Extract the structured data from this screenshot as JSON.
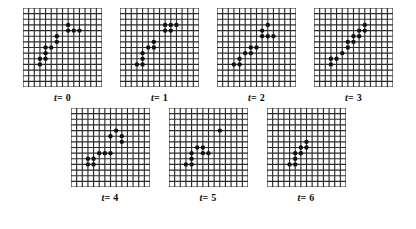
{
  "figure": {
    "title": "",
    "grid": {
      "cols": 14,
      "rows": 14,
      "cell_px": 5.4,
      "line_color": "#2b2b2b",
      "line_width": 1.1,
      "background": "#ffffff"
    },
    "dot": {
      "color": "#111111",
      "radius_px": 2.1,
      "shape": "filled-circle"
    },
    "label_prefix": "t",
    "label_equals": "=",
    "panels": [
      {
        "name": "panel-t0",
        "label_value": "0",
        "label_text": "t= 0",
        "dot_count": 12,
        "cells": [
          [
            3,
            10
          ],
          [
            3,
            9
          ],
          [
            4,
            9
          ],
          [
            4,
            8
          ],
          [
            4,
            7
          ],
          [
            5,
            7
          ],
          [
            6,
            6
          ],
          [
            6,
            5
          ],
          [
            8,
            3
          ],
          [
            8,
            4
          ],
          [
            9,
            4
          ],
          [
            10,
            4
          ]
        ]
      },
      {
        "name": "panel-t1",
        "label_value": "1",
        "label_text": "t= 1",
        "dot_count": 12,
        "cells": [
          [
            3,
            10
          ],
          [
            4,
            10
          ],
          [
            4,
            9
          ],
          [
            4,
            8
          ],
          [
            5,
            7
          ],
          [
            6,
            7
          ],
          [
            6,
            6
          ],
          [
            8,
            3
          ],
          [
            8,
            4
          ],
          [
            9,
            4
          ],
          [
            9,
            3
          ],
          [
            10,
            3
          ]
        ]
      },
      {
        "name": "panel-t2",
        "label_value": "2",
        "label_text": "t= 2",
        "dot_count": 12,
        "cells": [
          [
            3,
            10
          ],
          [
            4,
            10
          ],
          [
            4,
            9
          ],
          [
            5,
            8
          ],
          [
            6,
            8
          ],
          [
            6,
            7
          ],
          [
            7,
            7
          ],
          [
            8,
            4
          ],
          [
            8,
            5
          ],
          [
            9,
            5
          ],
          [
            9,
            3
          ],
          [
            10,
            5
          ]
        ]
      },
      {
        "name": "panel-t3",
        "label_value": "3",
        "label_text": "t= 3",
        "dot_count": 12,
        "cells": [
          [
            3,
            10
          ],
          [
            3,
            9
          ],
          [
            4,
            9
          ],
          [
            5,
            8
          ],
          [
            6,
            7
          ],
          [
            6,
            6
          ],
          [
            7,
            6
          ],
          [
            7,
            5
          ],
          [
            8,
            5
          ],
          [
            8,
            4
          ],
          [
            9,
            4
          ],
          [
            9,
            3
          ]
        ]
      },
      {
        "name": "panel-t4",
        "label_value": "4",
        "label_text": "t= 4",
        "dot_count": 11,
        "cells": [
          [
            3,
            10
          ],
          [
            3,
            9
          ],
          [
            4,
            10
          ],
          [
            4,
            9
          ],
          [
            5,
            8
          ],
          [
            6,
            8
          ],
          [
            7,
            8
          ],
          [
            7,
            5
          ],
          [
            8,
            4
          ],
          [
            9,
            5
          ],
          [
            9,
            6
          ]
        ]
      },
      {
        "name": "panel-t5",
        "label_value": "5",
        "label_text": "t= 5",
        "dot_count": 9,
        "cells": [
          [
            3,
            10
          ],
          [
            4,
            10
          ],
          [
            4,
            9
          ],
          [
            4,
            8
          ],
          [
            5,
            7
          ],
          [
            6,
            7
          ],
          [
            6,
            8
          ],
          [
            7,
            8
          ],
          [
            9,
            4
          ]
        ]
      },
      {
        "name": "panel-t6",
        "label_value": "6",
        "label_text": "t= 6",
        "dot_count": 8,
        "cells": [
          [
            4,
            10
          ],
          [
            5,
            10
          ],
          [
            5,
            9
          ],
          [
            5,
            8
          ],
          [
            6,
            8
          ],
          [
            6,
            7
          ],
          [
            7,
            7
          ],
          [
            7,
            6
          ]
        ]
      }
    ]
  }
}
